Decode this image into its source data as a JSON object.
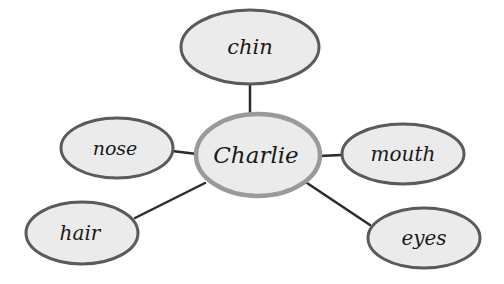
{
  "diagram": {
    "type": "mind-map",
    "colors": {
      "node_fill": "#ebebeb",
      "node_stroke": "#5a5a5a",
      "center_stroke": "#9a9a9a",
      "connector": "#2a2a2a",
      "text": "#1a1a1a"
    },
    "center": {
      "label": "Charlie",
      "cx": 258,
      "cy": 155,
      "rx": 62,
      "ry": 41
    },
    "branches": [
      {
        "label": "chin",
        "cx": 250,
        "cy": 47,
        "rx": 69,
        "ry": 37
      },
      {
        "label": "nose",
        "cx": 117,
        "cy": 148,
        "rx": 56,
        "ry": 30
      },
      {
        "label": "mouth",
        "cx": 403,
        "cy": 154,
        "rx": 61,
        "ry": 30
      },
      {
        "label": "hair",
        "cx": 82,
        "cy": 233,
        "rx": 56,
        "ry": 31
      },
      {
        "label": "eyes",
        "cx": 424,
        "cy": 238,
        "rx": 56,
        "ry": 30
      }
    ]
  }
}
